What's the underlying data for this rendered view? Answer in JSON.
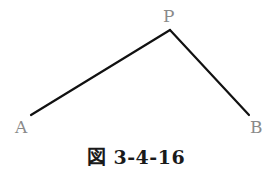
{
  "diagram": {
    "points": {
      "A": {
        "label": "A",
        "x": 31,
        "y": 115
      },
      "P": {
        "label": "P",
        "x": 170,
        "y": 30
      },
      "B": {
        "label": "B",
        "x": 249,
        "y": 115
      }
    },
    "segments": [
      {
        "from": "A",
        "to": "P"
      },
      {
        "from": "P",
        "to": "B"
      }
    ],
    "line_color": "#111111",
    "label_color": "#8a8a8a"
  },
  "caption": "図 3-4-16"
}
